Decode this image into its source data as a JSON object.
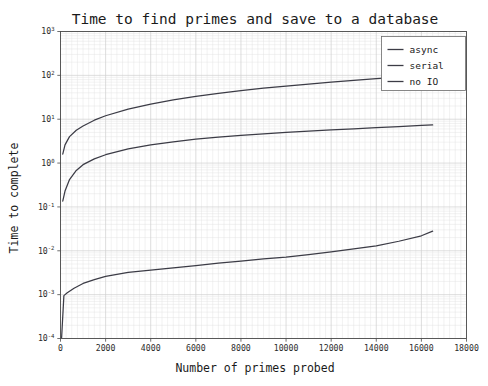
{
  "figure": {
    "width": 488,
    "height": 386,
    "background": "#ffffff"
  },
  "chart_data": {
    "type": "line",
    "title": "Time to find primes and save to a database",
    "xlabel": "Number of primes probed",
    "ylabel": "Time to complete",
    "xscale": "linear",
    "yscale": "log",
    "xlim": [
      0,
      18000
    ],
    "ylim": [
      0.0001,
      1000
    ],
    "grid": true,
    "grid_minor": true,
    "legend_position": "upper right",
    "xticks": [
      0,
      2000,
      4000,
      6000,
      8000,
      10000,
      12000,
      14000,
      16000,
      18000
    ],
    "xtick_labels": [
      "0",
      "2000",
      "4000",
      "6000",
      "8000",
      "10000",
      "12000",
      "14000",
      "16000",
      "18000"
    ],
    "yticks": [
      0.0001,
      0.001,
      0.01,
      0.1,
      1,
      10,
      100,
      1000
    ],
    "ytick_labels": [
      "10⁻⁴",
      "10⁻³",
      "10⁻²",
      "10⁻¹",
      "10⁰",
      "10¹",
      "10²",
      "10³"
    ],
    "ytick_mantissa": "10",
    "ytick_exponents": [
      "-4",
      "-3",
      "-2",
      "-1",
      "0",
      "1",
      "2",
      "3"
    ],
    "line_color": "#3c3c46",
    "series": [
      {
        "name": "async",
        "x": [
          100,
          200,
          400,
          700,
          1000,
          1500,
          2000,
          3000,
          4000,
          5000,
          6000,
          7000,
          8000,
          9000,
          10000,
          11000,
          12000,
          13000,
          14000,
          15000,
          16000,
          16500
        ],
        "values": [
          1.6,
          2.6,
          4.0,
          5.6,
          7.0,
          9.5,
          12.0,
          17.0,
          22.0,
          27.5,
          33.0,
          39.0,
          45.0,
          51.0,
          57.0,
          63.0,
          70.0,
          77.0,
          84.0,
          91.0,
          98.0,
          101.0
        ]
      },
      {
        "name": "serial",
        "x": [
          100,
          200,
          400,
          700,
          1000,
          1500,
          2000,
          3000,
          4000,
          5000,
          6000,
          7000,
          8000,
          9000,
          10000,
          11000,
          12000,
          13000,
          14000,
          15000,
          16000,
          16500
        ],
        "values": [
          0.135,
          0.23,
          0.42,
          0.68,
          0.92,
          1.25,
          1.55,
          2.1,
          2.6,
          3.05,
          3.5,
          3.9,
          4.3,
          4.65,
          5.0,
          5.35,
          5.7,
          6.05,
          6.4,
          6.8,
          7.2,
          7.4
        ]
      },
      {
        "name": "no IO",
        "x": [
          50,
          150,
          300,
          600,
          1000,
          1500,
          2000,
          3000,
          4000,
          5000,
          6000,
          7000,
          8000,
          9000,
          10000,
          11000,
          12000,
          13000,
          14000,
          15000,
          16000,
          16500
        ],
        "values": [
          0.000105,
          0.00095,
          0.0011,
          0.0014,
          0.0018,
          0.0022,
          0.0026,
          0.0032,
          0.0036,
          0.0041,
          0.0046,
          0.0052,
          0.0058,
          0.0065,
          0.0072,
          0.0082,
          0.0095,
          0.011,
          0.013,
          0.0165,
          0.022,
          0.028
        ]
      }
    ],
    "legend_entries": [
      "async",
      "serial",
      "no IO"
    ]
  }
}
